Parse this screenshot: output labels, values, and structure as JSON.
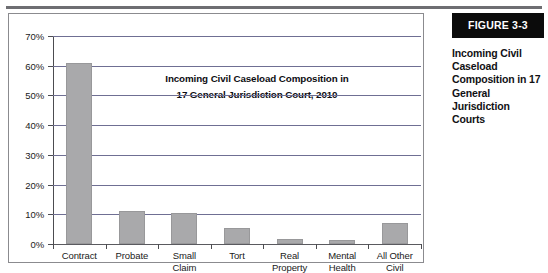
{
  "figure": {
    "banner_label": "FIGURE 3-3",
    "caption": "Incoming Civil Caseload Composition in 17 General Jurisdiction Courts"
  },
  "chart_data": {
    "type": "bar",
    "title": "Incoming Civil Caseload Composition in\n17 General Jurisdiction Court, 2010",
    "title_line1": "Incoming Civil Caseload Composition in",
    "title_line2": "17 General Jurisdiction Court, 2010",
    "xlabel": "",
    "ylabel": "",
    "ylim": [
      0,
      70
    ],
    "ytick_step": 10,
    "grid": true,
    "legend": "none",
    "bar_color": "#a9a9ab",
    "categories": [
      "Contract",
      "Probate",
      "Small Claim",
      "Tort",
      "Real Property",
      "Mental Health",
      "All Other Civil"
    ],
    "category_lines": [
      [
        "Contract"
      ],
      [
        "Probate"
      ],
      [
        "Small",
        "Claim"
      ],
      [
        "Tort"
      ],
      [
        "Real",
        "Property"
      ],
      [
        "Mental",
        "Health"
      ],
      [
        "All Other",
        "Civil"
      ]
    ],
    "values": [
      61,
      11,
      10.5,
      5.5,
      1.8,
      1.5,
      7
    ],
    "ytick_labels": [
      "70%",
      "60%",
      "50%",
      "40%",
      "30%",
      "20%",
      "10%",
      "0%"
    ],
    "ytick_values": [
      70,
      60,
      50,
      40,
      30,
      20,
      10,
      0
    ]
  }
}
